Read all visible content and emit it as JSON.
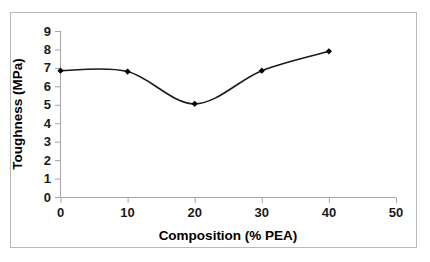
{
  "chart_data": {
    "type": "line",
    "title": "",
    "subtitle": "",
    "xlabel": "Composition (% PEA)",
    "ylabel": "Toughness (MPa)",
    "x": [
      0,
      10,
      20,
      30,
      40
    ],
    "values": [
      6.85,
      6.8,
      5.05,
      6.85,
      7.9
    ],
    "series": [
      {
        "name": "Toughness",
        "x": [
          0,
          10,
          20,
          30,
          40
        ],
        "values": [
          6.85,
          6.8,
          5.05,
          6.85,
          7.9
        ]
      }
    ],
    "xlim": [
      0,
      50
    ],
    "ylim": [
      0,
      9
    ],
    "xticks": [
      0,
      10,
      20,
      30,
      40,
      50
    ],
    "yticks": [
      0,
      1,
      2,
      3,
      4,
      5,
      6,
      7,
      8,
      9
    ],
    "xtick_labels": [
      "0",
      "10",
      "20",
      "30",
      "40",
      "50"
    ],
    "ytick_labels": [
      "0",
      "1",
      "2",
      "3",
      "4",
      "5",
      "6",
      "7",
      "8",
      "9"
    ],
    "grid": false,
    "legend": false,
    "legend_position": "none",
    "smoothing": "spline",
    "marker": "diamond",
    "line_color": "#1a1a1a",
    "marker_color": "#000000",
    "axis_color": "#a6a6a6",
    "background_color": "#ffffff",
    "border_color": "#b9b9b9"
  },
  "axes": {
    "x_title": "Composition (% PEA)",
    "y_title": "Toughness (MPa)",
    "x_tick_labels": [
      "0",
      "10",
      "20",
      "30",
      "40",
      "50"
    ],
    "y_tick_labels": [
      "0",
      "1",
      "2",
      "3",
      "4",
      "5",
      "6",
      "7",
      "8",
      "9"
    ]
  }
}
